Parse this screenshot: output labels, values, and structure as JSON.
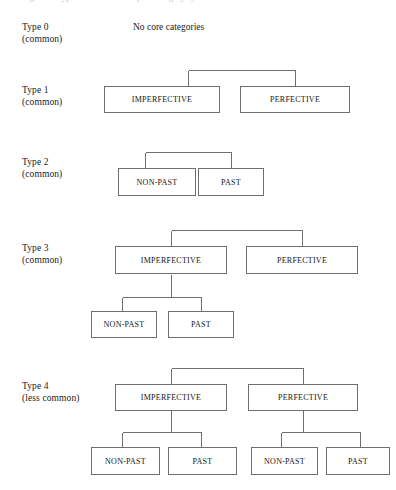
{
  "page": {
    "width": 396,
    "height": 490,
    "background": "#ffffff",
    "line_color": "#6f6f72",
    "text_color": "#141414",
    "cropped_caption": "Figure 1: Types of core tense-aspect category systems"
  },
  "labels": {
    "type0": {
      "line1": "Type 0",
      "line2": "(common)"
    },
    "type1": {
      "line1": "Type 1",
      "line2": "(common)"
    },
    "type2": {
      "line1": "Type 2",
      "line2": "(common)"
    },
    "type3": {
      "line1": "Type 3",
      "line2": "(common)"
    },
    "type4": {
      "line1": "Type 4",
      "line2": "(less common)"
    }
  },
  "notes": {
    "no_core_categories": "No core categories"
  },
  "nodes": {
    "imperfective": "IMPERFECTIVE",
    "perfective": "PERFECTIVE",
    "nonpast": "NON-PAST",
    "past": "PAST"
  },
  "diagrams": [
    {
      "id": "type0",
      "label_line1": "Type 0",
      "label_line2": "(common)",
      "boxes": [],
      "note": "No core categories"
    },
    {
      "id": "type1",
      "label_line1": "Type 1",
      "label_line2": "(common)",
      "boxes": [
        "IMPERFECTIVE",
        "PERFECTIVE"
      ]
    },
    {
      "id": "type2",
      "label_line1": "Type 2",
      "label_line2": "(common)",
      "boxes": [
        "NON-PAST",
        "PAST"
      ]
    },
    {
      "id": "type3",
      "label_line1": "Type 3",
      "label_line2": "(common)",
      "boxes": [
        "IMPERFECTIVE",
        "PERFECTIVE",
        "NON-PAST",
        "PAST"
      ]
    },
    {
      "id": "type4",
      "label_line1": "Type 4",
      "label_line2": "(less common)",
      "boxes": [
        "IMPERFECTIVE",
        "PERFECTIVE",
        "NON-PAST",
        "PAST",
        "NON-PAST",
        "PAST"
      ]
    }
  ]
}
